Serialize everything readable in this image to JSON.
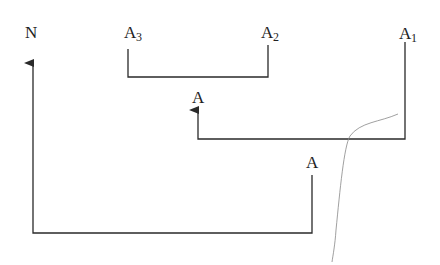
{
  "diagram": {
    "labels": {
      "n": {
        "base": "N",
        "sub": ""
      },
      "a3": {
        "base": "A",
        "sub": "3"
      },
      "a2": {
        "base": "A",
        "sub": "2"
      },
      "a1": {
        "base": "A",
        "sub": "1"
      },
      "a_middle": {
        "base": "A",
        "sub": ""
      },
      "a_bottom": {
        "base": "A",
        "sub": ""
      }
    },
    "colors": {
      "line": "#2a2a2a",
      "text": "#222222",
      "curve": "#888888"
    }
  }
}
